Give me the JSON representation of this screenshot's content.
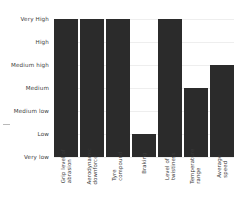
{
  "chart_data": {
    "type": "bar",
    "title": "",
    "subtitle": "",
    "xlabel": "",
    "ylabel": "",
    "orientation": "vertical",
    "grid": true,
    "legend": null,
    "bar_color": "#2b2b2b",
    "background_color": "#ffffff",
    "gridline_color": "#eeeeee",
    "tick_label_color": "#3a3a3a",
    "xtick_rotation": 90,
    "y_scale": "ordinal",
    "ylim": [
      "Very low",
      "Very High"
    ],
    "y_tick_labels": [
      "Very High",
      "High",
      "Medium high",
      "Medium",
      "Medium low",
      "Low",
      "Very low"
    ],
    "y_levels_bottom_to_top": [
      "Very low",
      "Low",
      "Medium low",
      "Medium",
      "Medium high",
      "High",
      "Very High"
    ],
    "categories": [
      "Grip level of abrasion",
      "Aerodynamic downforce",
      "Tyre compound",
      "Braking",
      "Level of twistiness",
      "Temperature range",
      "Average speed"
    ],
    "category_lines": [
      [
        "Grip level of",
        "abrasion"
      ],
      [
        "Aerodynamic",
        "downforce"
      ],
      [
        "Tyre",
        "compound"
      ],
      [
        "Braking"
      ],
      [
        "Level of",
        "twistiness"
      ],
      [
        "Temperature",
        "range"
      ],
      [
        "Average",
        "speed"
      ]
    ],
    "values": [
      "Very High",
      "Very High",
      "Very High",
      "Low",
      "Very High",
      "Medium",
      "Medium high"
    ],
    "values_numeric": [
      7,
      7,
      7,
      2,
      7,
      4,
      5
    ],
    "bars": [
      {
        "category": "Grip level of abrasion",
        "value": "Very High",
        "level": 7
      },
      {
        "category": "Aerodynamic downforce",
        "value": "Very High",
        "level": 7
      },
      {
        "category": "Tyre compound",
        "value": "Very High",
        "level": 7
      },
      {
        "category": "Braking",
        "value": "Low",
        "level": 2
      },
      {
        "category": "Level of twistiness",
        "value": "Very High",
        "level": 7
      },
      {
        "category": "Temperature range",
        "value": "Medium",
        "level": 4
      },
      {
        "category": "Average speed",
        "value": "Medium high",
        "level": 5
      }
    ]
  }
}
